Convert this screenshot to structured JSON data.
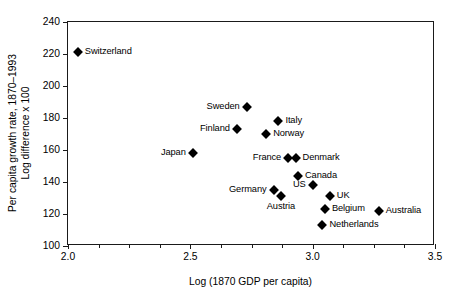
{
  "chart_data": {
    "type": "scatter",
    "title": "",
    "xlabel": "Log (1870 GDP per capita)",
    "ylabel_line1": "Per capita growth rate, 1870–1993",
    "ylabel_line2": "Log difference x 100",
    "xlim": [
      2.0,
      3.5
    ],
    "ylim": [
      100,
      240
    ],
    "xticks": [
      2.0,
      2.5,
      3.0,
      3.5
    ],
    "xtick_labels": [
      "2.0",
      "2.5",
      "3.0",
      "3.5"
    ],
    "x_minor_ticks": [
      2.125,
      2.25,
      2.375,
      2.625,
      2.75,
      2.875,
      3.125,
      3.25,
      3.375
    ],
    "yticks": [
      100,
      120,
      140,
      160,
      180,
      200,
      220,
      240
    ],
    "ytick_labels": [
      "100",
      "120",
      "140",
      "160",
      "180",
      "200",
      "220",
      "240"
    ],
    "grid": false,
    "legend": "none",
    "marker": "filled-diamond",
    "marker_color": "#000000",
    "points": [
      {
        "label": "Switzerland",
        "x": 2.04,
        "y": 221,
        "label_pos": "right"
      },
      {
        "label": "Japan",
        "x": 2.51,
        "y": 158,
        "label_pos": "left"
      },
      {
        "label": "Sweden",
        "x": 2.73,
        "y": 187,
        "label_pos": "left"
      },
      {
        "label": "Finland",
        "x": 2.69,
        "y": 173,
        "label_pos": "left"
      },
      {
        "label": "Italy",
        "x": 2.86,
        "y": 178,
        "label_pos": "right"
      },
      {
        "label": "Norway",
        "x": 2.81,
        "y": 170,
        "label_pos": "right"
      },
      {
        "label": "France",
        "x": 2.9,
        "y": 155,
        "label_pos": "left"
      },
      {
        "label": "Denmark",
        "x": 2.93,
        "y": 155,
        "label_pos": "right"
      },
      {
        "label": "Canada",
        "x": 2.94,
        "y": 144,
        "label_pos": "right"
      },
      {
        "label": "Germany",
        "x": 2.84,
        "y": 135,
        "label_pos": "left"
      },
      {
        "label": "Austria",
        "x": 2.87,
        "y": 131,
        "label_pos": "below"
      },
      {
        "label": "US",
        "x": 3.0,
        "y": 138,
        "label_pos": "left"
      },
      {
        "label": "UK",
        "x": 3.07,
        "y": 131,
        "label_pos": "right"
      },
      {
        "label": "Belgium",
        "x": 3.05,
        "y": 123,
        "label_pos": "right"
      },
      {
        "label": "Netherlands",
        "x": 3.04,
        "y": 113,
        "label_pos": "right"
      },
      {
        "label": "Australia",
        "x": 3.27,
        "y": 122,
        "label_pos": "right"
      }
    ]
  }
}
